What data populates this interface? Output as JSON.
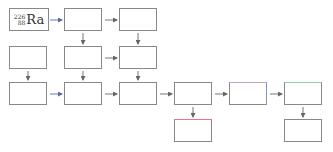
{
  "diagram": {
    "start_node": {
      "mass_number": "226",
      "atomic_number": "88",
      "symbol": "Ra"
    },
    "nodes": [
      {
        "id": "n1",
        "label": ""
      },
      {
        "id": "n2",
        "label": ""
      },
      {
        "id": "n3",
        "label": ""
      },
      {
        "id": "n4",
        "label": ""
      },
      {
        "id": "n5",
        "label": ""
      },
      {
        "id": "n6",
        "label": ""
      },
      {
        "id": "n7",
        "label": ""
      },
      {
        "id": "n8",
        "label": ""
      },
      {
        "id": "n9",
        "label": ""
      },
      {
        "id": "n10",
        "label": ""
      },
      {
        "id": "n11",
        "label": ""
      },
      {
        "id": "n12",
        "label": ""
      },
      {
        "id": "n13",
        "label": ""
      }
    ],
    "colors": {
      "box_border": "#888888",
      "arrow_gray": "#777777",
      "arrow_blue": "#6a78b0",
      "accent_red": "#e07a8a",
      "accent_purple": "#b088c0",
      "accent_green": "#88d8a0"
    }
  }
}
